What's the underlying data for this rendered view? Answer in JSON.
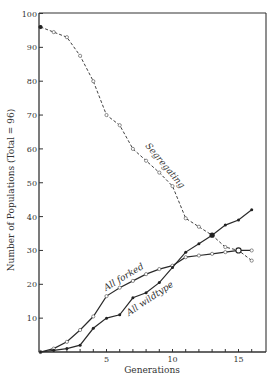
{
  "chart_data": {
    "type": "line",
    "title": "",
    "xlabel": "Generations",
    "ylabel": "Number of Populations  (Total = 96)",
    "xlim": [
      0,
      16.8
    ],
    "ylim": [
      0,
      100
    ],
    "x_ticks": [
      1,
      2,
      3,
      4,
      5,
      6,
      7,
      8,
      9,
      10,
      11,
      12,
      13,
      14,
      15,
      16
    ],
    "x_tick_labels": [
      {
        "x": 5,
        "label": "5"
      },
      {
        "x": 10,
        "label": "10"
      },
      {
        "x": 15,
        "label": "15"
      }
    ],
    "y_ticks": [
      10,
      20,
      30,
      40,
      50,
      60,
      70,
      80,
      90,
      100
    ],
    "y_tick_labels": [
      "10",
      "20",
      "30",
      "40",
      "50",
      "60",
      "70",
      "80",
      "90",
      "100"
    ],
    "grid": false,
    "legend": "inline labels",
    "x": [
      0,
      1,
      2,
      3,
      4,
      5,
      6,
      7,
      8,
      9,
      10,
      11,
      12,
      13,
      14,
      15,
      16
    ],
    "series": [
      {
        "name": "Segregating",
        "style": "dashed",
        "marker": "open-circle",
        "values": [
          96,
          94.5,
          93,
          87.5,
          80,
          70,
          67,
          60,
          56.5,
          53,
          49,
          39.5,
          37,
          34.5,
          31,
          30,
          27
        ]
      },
      {
        "name": "All forked",
        "style": "solid",
        "marker": "open-circle",
        "values": [
          0,
          1,
          3,
          6.5,
          10.5,
          16.5,
          19,
          21,
          23,
          24.5,
          25.5,
          28,
          28.5,
          29,
          29.5,
          30,
          30
        ]
      },
      {
        "name": "All wildtype",
        "style": "solid",
        "marker": "filled-dot",
        "values": [
          0,
          0.5,
          1,
          2,
          7,
          10,
          11,
          16,
          17.5,
          20.5,
          25,
          29.5,
          32,
          34.5,
          37.5,
          39,
          42
        ]
      }
    ],
    "annotations": [
      {
        "text": "Segregating",
        "near_x": 8.5,
        "near_y": 58
      },
      {
        "text": "All forked",
        "near_x": 6.5,
        "near_y": 21
      },
      {
        "text": "All wildtype",
        "near_x": 8.5,
        "near_y": 15
      }
    ]
  },
  "labels": {
    "xlabel": "Generations",
    "ylabel": "Number of Populations  (Total = 96)",
    "segregating": "Segregating",
    "forked": "All forked",
    "wildtype": "All wildtype"
  }
}
